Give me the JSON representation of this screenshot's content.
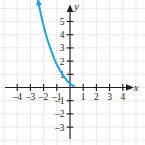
{
  "figure": {
    "name": "exponential-decay-graph",
    "background_color": "#ffffff",
    "grid_color": "#e9e9ea",
    "axis_color": "#231f20",
    "curve_color": "#2ba6d4",
    "label_color": "#231f20"
  },
  "chart_data": {
    "type": "line",
    "title": "",
    "subtitle": "",
    "xlabel": "x",
    "ylabel": "y",
    "xlim": [
      -4.8,
      4.8
    ],
    "ylim": [
      -3.8,
      6.8
    ],
    "grid": true,
    "grid_step": 1,
    "legend": null,
    "legend_position": "none",
    "x_ticks": [
      -4,
      -3,
      -2,
      -1,
      1,
      2,
      3,
      4
    ],
    "x_tick_labels": [
      "–4",
      "–3",
      "–2",
      "–1",
      "1",
      "2",
      "3",
      "4"
    ],
    "y_ticks": [
      5,
      4,
      3,
      2,
      1,
      -1,
      -2,
      -3
    ],
    "y_tick_labels": [
      "5",
      "4",
      "3",
      "2",
      "1",
      "–1",
      "–2",
      "–3"
    ],
    "annotations": [],
    "series": [
      {
        "name": "exponential-decay-curve",
        "color": "#2ba6d4",
        "arrow_start": true,
        "arrow_end": false,
        "asymptote_y": 0,
        "x": [
          -2.42,
          -2.3,
          -2.1,
          -1.9,
          -1.7,
          -1.5,
          -1.3,
          -1.1,
          -0.9,
          -0.7,
          -0.5,
          -0.3,
          -0.1,
          0.1,
          0.3
        ],
        "y": [
          6.6,
          6.0,
          5.1,
          4.3,
          3.6,
          3.0,
          2.45,
          1.95,
          1.55,
          1.2,
          0.9,
          0.62,
          0.38,
          0.22,
          0.12
        ]
      }
    ]
  },
  "axes": {
    "x_axis": {
      "label": "x",
      "arrow_right": true,
      "arrow_left": false
    },
    "y_axis": {
      "label": "y",
      "arrow_up": true,
      "arrow_down": false
    }
  }
}
